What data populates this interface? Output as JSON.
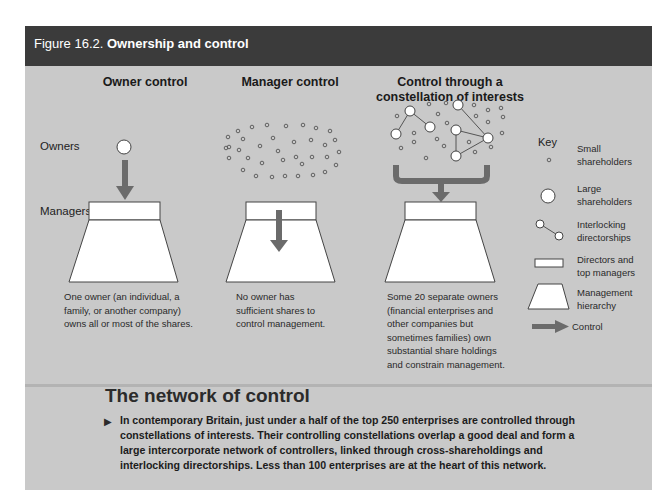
{
  "header": {
    "figure_number": "Figure 16.2.",
    "figure_title": "Ownership and control",
    "colors": {
      "bar": "#3b3b3b",
      "panel": "#c9c9c9",
      "arrow": "#6b6b6b",
      "shape_fill": "#ffffff"
    }
  },
  "columns": [
    {
      "title": "Owner control",
      "caption": "One owner (an individual, a family, or another company) owns all or most of the shares."
    },
    {
      "title": "Manager control",
      "caption": "No owner has sufficient shares to control management."
    },
    {
      "title_line1": "Control through a",
      "title_line2": "constellation of interests",
      "caption": "Some 20 separate owners (financial enterprises and other companies but sometimes families) own substantial share holdings and constrain management."
    }
  ],
  "row_labels": {
    "owners": "Owners",
    "managers": "Managers"
  },
  "key": {
    "title": "Key",
    "items": [
      {
        "icon": "small-circle-icon",
        "label_line1": "Small",
        "label_line2": "shareholders"
      },
      {
        "icon": "large-circle-icon",
        "label_line1": "Large",
        "label_line2": "shareholders"
      },
      {
        "icon": "linked-circles-icon",
        "label_line1": "Interlocking",
        "label_line2": "directorships"
      },
      {
        "icon": "rectangle-icon",
        "label_line1": "Directors and",
        "label_line2": "top managers"
      },
      {
        "icon": "trapezoid-icon",
        "label_line1": "Management",
        "label_line2": "hierarchy"
      },
      {
        "icon": "arrow-right-icon",
        "label_line1": "Control"
      }
    ]
  },
  "section": {
    "title": "The network of control",
    "bullet_icon": "triangle-right-icon",
    "body": "In contemporary Britain, just under a half of the top 250 enterprises are controlled through constellations of interests. Their controlling constellations overlap a good deal and form a large intercorporate network of controllers, linked through cross-shareholdings and interlocking directorships. Less than 100 enterprises are at the heart of this network."
  }
}
